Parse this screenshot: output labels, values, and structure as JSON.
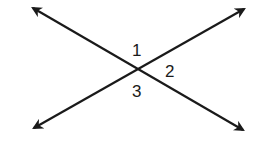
{
  "diagram": {
    "type": "intersecting-lines",
    "line_color": "#1a1a1a",
    "background": "#ffffff",
    "intersection": {
      "x": 137,
      "y": 67
    },
    "lines": [
      {
        "name": "line-a",
        "from": {
          "x": 30,
          "y": 6
        },
        "to": {
          "x": 246,
          "y": 132
        }
      },
      {
        "name": "line-b",
        "from": {
          "x": 31,
          "y": 130
        },
        "to": {
          "x": 247,
          "y": 7
        }
      }
    ],
    "angle_labels": [
      {
        "id": "angle-1",
        "text": "1",
        "x": 138,
        "y": 56
      },
      {
        "id": "angle-2",
        "text": "2",
        "x": 172,
        "y": 76
      },
      {
        "id": "angle-3",
        "text": "3",
        "x": 138,
        "y": 97
      }
    ]
  }
}
